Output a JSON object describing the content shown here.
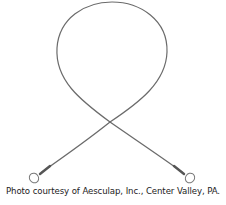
{
  "image": {
    "subject": "gigli-wire-saw",
    "wire_color": "#6e6e6e",
    "background": "#ffffff"
  },
  "caption": {
    "text": "Photo courtesy of Aesculap, Inc., Center Valley, PA."
  }
}
